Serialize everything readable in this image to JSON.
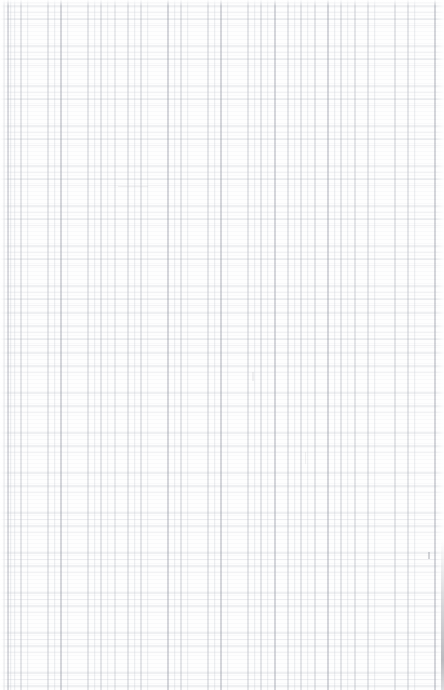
{
  "document": {
    "kind": "grid-paper-sheet",
    "title": "",
    "content_text": "",
    "page_width_px": 444,
    "page_height_px": 690,
    "background_color": "#fefefe"
  },
  "grid": {
    "cell_size_px": 13.34,
    "origin_x_px": 7.5,
    "origin_y_px": 5.5,
    "vertical_line_color": "#969ba5",
    "horizontal_line_color": "#afb4be",
    "major_vertical_line_color": "#8a909c",
    "major_every_n_cells": 4,
    "vertical_line_count": 33,
    "horizontal_line_count": 52,
    "line_width_px": 0.7
  },
  "artifacts": {
    "right_edge_mark_color": "#82848c",
    "scan_texture_color": "#eceef2"
  }
}
